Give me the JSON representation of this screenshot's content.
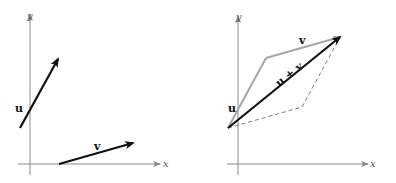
{
  "figure": {
    "left_panel": {
      "axis_labels": {
        "x": "x",
        "y": "y"
      },
      "vectors": [
        {
          "name": "u",
          "label": "u",
          "from": [
            20,
            128
          ],
          "to": [
            58,
            59
          ],
          "color": "#111111"
        },
        {
          "name": "v",
          "label": "v",
          "from": [
            59,
            164
          ],
          "to": [
            133,
            143
          ],
          "color": "#111111"
        }
      ]
    },
    "right_panel": {
      "axis_labels": {
        "x": "x",
        "y": "y"
      },
      "vectors": [
        {
          "name": "u",
          "label": "u",
          "from": [
            228,
            128
          ],
          "to": [
            266,
            58
          ],
          "color": "#a6a6a6"
        },
        {
          "name": "v",
          "label": "v",
          "from": [
            266,
            58
          ],
          "to": [
            340,
            37
          ],
          "color": "#a6a6a6"
        },
        {
          "name": "u_plus_v",
          "label": "u + v",
          "from": [
            228,
            128
          ],
          "to": [
            340,
            37
          ],
          "color": "#111111"
        }
      ],
      "dashed_parallelogram_edges": [
        [
          228,
          128
        ],
        [
          302,
          107
        ],
        [
          340,
          37
        ]
      ]
    }
  }
}
